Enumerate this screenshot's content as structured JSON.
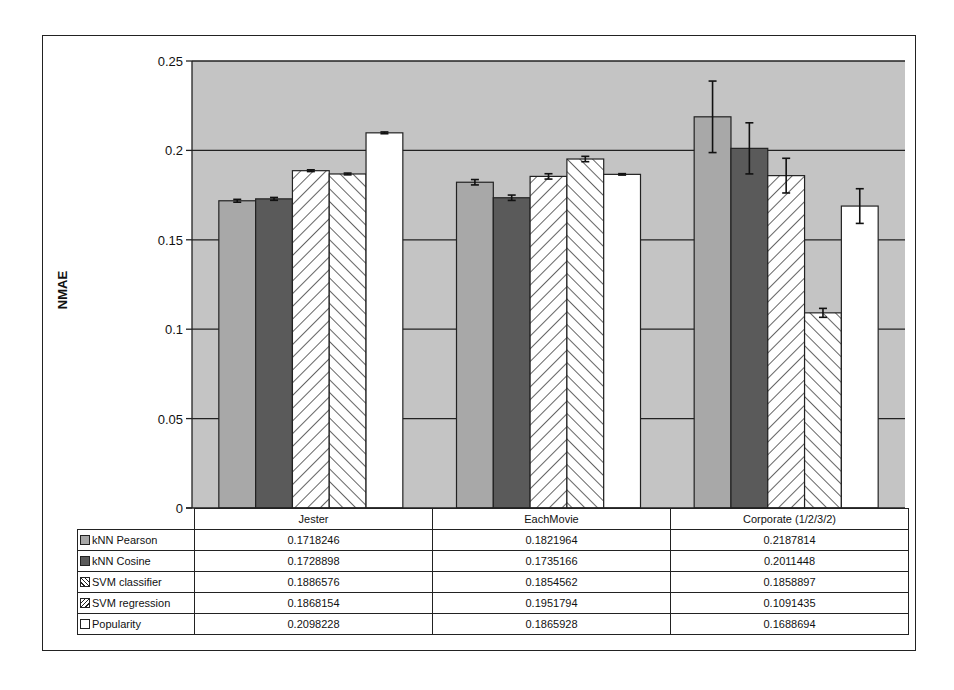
{
  "chart_data": {
    "type": "bar",
    "title": "",
    "xlabel": "",
    "ylabel": "NMAE",
    "ylim": [
      0,
      0.25
    ],
    "yticks": [
      "0",
      "0.05",
      "0.1",
      "0.15",
      "0.2",
      "0.25"
    ],
    "grid": true,
    "legend_position": "data-table",
    "categories": [
      "Jester",
      "EachMovie",
      "Corporate (1/2/3/2)"
    ],
    "series": [
      {
        "name": "kNN Pearson",
        "pattern": "solid-light",
        "color": "#a8a8a8",
        "values": [
          0.1718246,
          0.1821964,
          0.2187814
        ],
        "display": [
          "0.1718246",
          "0.1821964",
          "0.2187814"
        ],
        "errors": [
          0.0008,
          0.0015,
          0.02
        ]
      },
      {
        "name": "kNN Cosine",
        "pattern": "solid-dark",
        "color": "#5a5a5a",
        "values": [
          0.1728898,
          0.1735166,
          0.2011448
        ],
        "display": [
          "0.1728898",
          "0.1735166",
          "0.2011448"
        ],
        "errors": [
          0.0008,
          0.0015,
          0.0143
        ]
      },
      {
        "name": "SVM classifier",
        "pattern": "hatch-back",
        "color": "#ffffff",
        "values": [
          0.1886576,
          0.1854562,
          0.1858897
        ],
        "display": [
          "0.1886576",
          "0.1854562",
          "0.1858897"
        ],
        "errors": [
          0.0005,
          0.0015,
          0.0097
        ]
      },
      {
        "name": "SVM regression",
        "pattern": "hatch-fwd",
        "color": "#ffffff",
        "values": [
          0.1868154,
          0.1951794,
          0.1091435
        ],
        "display": [
          "0.1868154",
          "0.1951794",
          "0.1091435"
        ],
        "errors": [
          0.0005,
          0.0015,
          0.0025
        ]
      },
      {
        "name": "Popularity",
        "pattern": "solid-white",
        "color": "#ffffff",
        "values": [
          0.2098228,
          0.1865928,
          0.1688694
        ],
        "display": [
          "0.2098228",
          "0.1865928",
          "0.1688694"
        ],
        "errors": [
          0.0005,
          0.0004,
          0.0097
        ]
      }
    ],
    "plot_background": "#c4c4c4"
  }
}
